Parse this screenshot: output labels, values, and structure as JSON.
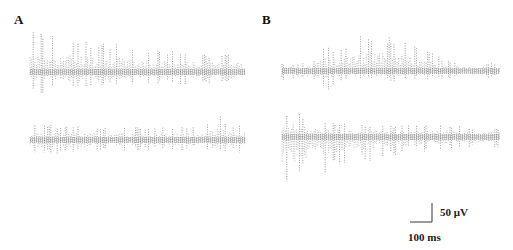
{
  "panels": [
    {
      "label": "A"
    },
    {
      "label": "B"
    }
  ],
  "scale_bar": {
    "voltage_label": "50 μV",
    "time_label": "100 ms"
  },
  "colors": {
    "trace": "#555555",
    "background": "#ffffff",
    "text": "#111111"
  },
  "chart_data": {
    "type": "line",
    "title": "",
    "xlabel": "",
    "ylabel": "",
    "grid": false,
    "legend": "none",
    "scale_bar": {
      "vertical": "50 μV",
      "horizontal": "100 ms"
    },
    "panels": [
      {
        "label": "A",
        "traces": [
          {
            "name": "A-upper",
            "description": "Spontaneous field potential; repeated upward spikes of ~90-110 μV early, gradually decreasing to ~40-60 μV toward end; downward deflections ~40-60 μV",
            "x_extent_px": [
              30,
              245
            ],
            "baseline_px": 72,
            "envelope_up_uV": [
              110,
              100,
              95,
              90,
              85,
              80,
              75,
              70,
              65,
              60,
              55,
              55,
              50,
              50,
              55,
              50
            ],
            "envelope_down_uV": [
              55,
              55,
              50,
              50,
              45,
              45,
              40,
              40,
              40,
              35,
              35,
              35,
              35,
              35,
              35,
              35
            ]
          },
          {
            "name": "A-lower",
            "description": "Lower amplitude activity ~40 μV up / ~40 μV down with one isolated spike ~75 μV near the end",
            "x_extent_px": [
              30,
              245
            ],
            "baseline_px": 140,
            "envelope_up_uV": [
              40,
              40,
              40,
              40,
              35,
              35,
              35,
              35,
              35,
              35,
              35,
              35,
              35,
              75,
              35,
              40
            ],
            "envelope_down_uV": [
              45,
              40,
              40,
              40,
              35,
              35,
              30,
              30,
              30,
              30,
              30,
              30,
              30,
              45,
              35,
              35
            ]
          }
        ]
      },
      {
        "label": "B",
        "traces": [
          {
            "name": "B-upper",
            "description": "Low baseline activity with a burst of large upward spikes (~100 μV) in the middle that waxes and wanes",
            "x_extent_px": [
              282,
              500
            ],
            "baseline_px": 71,
            "envelope_up_uV": [
              20,
              20,
              25,
              70,
              60,
              90,
              100,
              95,
              85,
              70,
              55,
              35,
              25,
              20,
              20,
              20
            ],
            "envelope_down_uV": [
              25,
              25,
              25,
              60,
              25,
              30,
              30,
              30,
              30,
              25,
              25,
              20,
              20,
              20,
              20,
              20
            ]
          },
          {
            "name": "B-lower",
            "description": "Large downward deflections (~140 μV) at onset decaying over time toward ~30 μV, with upward spikes ~60 μV early",
            "x_extent_px": [
              282,
              500
            ],
            "baseline_px": 137,
            "envelope_up_uV": [
              60,
              70,
              45,
              40,
              40,
              35,
              35,
              30,
              30,
              35,
              35,
              30,
              30,
              25,
              25,
              25
            ],
            "envelope_down_uV": [
              140,
              130,
              110,
              95,
              85,
              75,
              65,
              55,
              50,
              45,
              40,
              35,
              35,
              30,
              30,
              30
            ]
          }
        ]
      }
    ]
  }
}
